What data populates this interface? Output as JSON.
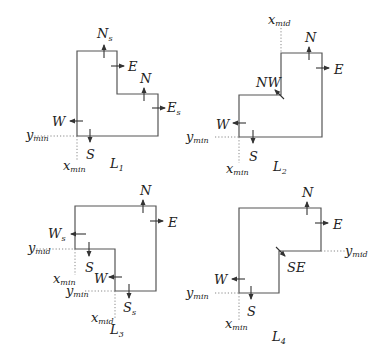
{
  "figure": {
    "panels": [
      {
        "id": "L1",
        "name": "L",
        "name_sub": "1",
        "labels": {
          "Ns": {
            "main": "N",
            "sub": "s"
          },
          "E": {
            "main": "E"
          },
          "N": {
            "main": "N"
          },
          "Es": {
            "main": "E",
            "sub": "s"
          },
          "W": {
            "main": "W"
          },
          "S": {
            "main": "S"
          },
          "ymin": {
            "main": "y",
            "sub": "min"
          },
          "xmin": {
            "main": "x",
            "sub": "min"
          }
        }
      },
      {
        "id": "L2",
        "name": "L",
        "name_sub": "2",
        "labels": {
          "xmid": {
            "main": "x",
            "sub": "mid"
          },
          "N": {
            "main": "N"
          },
          "E": {
            "main": "E"
          },
          "NW": {
            "main": "NW"
          },
          "W": {
            "main": "W"
          },
          "S": {
            "main": "S"
          },
          "ymin": {
            "main": "y",
            "sub": "min"
          },
          "xmin": {
            "main": "x",
            "sub": "min"
          }
        }
      },
      {
        "id": "L3",
        "name": "L",
        "name_sub": "3",
        "labels": {
          "N": {
            "main": "N"
          },
          "E": {
            "main": "E"
          },
          "Ws": {
            "main": "W",
            "sub": "s"
          },
          "ymid": {
            "main": "y",
            "sub": "mid"
          },
          "S": {
            "main": "S"
          },
          "xmin": {
            "main": "x",
            "sub": "min"
          },
          "W": {
            "main": "W"
          },
          "ymin": {
            "main": "y",
            "sub": "min"
          },
          "Ss": {
            "main": "S",
            "sub": "s"
          },
          "xmid": {
            "main": "x",
            "sub": "mid"
          }
        }
      },
      {
        "id": "L4",
        "name": "L",
        "name_sub": "4",
        "labels": {
          "N": {
            "main": "N"
          },
          "E": {
            "main": "E"
          },
          "ymid": {
            "main": "y",
            "sub": "mid"
          },
          "SE": {
            "main": "SE"
          },
          "W": {
            "main": "W"
          },
          "ymin": {
            "main": "y",
            "sub": "min"
          },
          "S": {
            "main": "S"
          },
          "xmin": {
            "main": "x",
            "sub": "min"
          }
        }
      }
    ]
  }
}
